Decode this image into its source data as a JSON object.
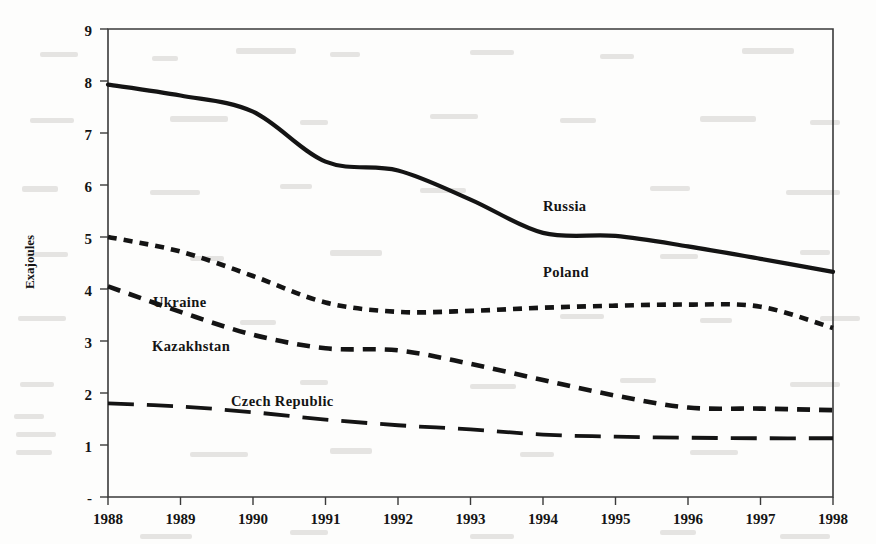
{
  "figure": {
    "background_color": "#fdfdfc",
    "ink_color": "#141414",
    "axis_color": "#3a3a3a"
  },
  "axes": {
    "y_axis_title": "Exajoules",
    "y_ticks": [
      "9",
      "8",
      "7",
      "6",
      "5",
      "4",
      "3",
      "2",
      "1",
      "-"
    ],
    "x_ticks": [
      "1988",
      "1989",
      "1990",
      "1991",
      "1992",
      "1993",
      "1994",
      "1995",
      "1996",
      "1997",
      "1998"
    ]
  },
  "series_labels": {
    "russia": "Russia",
    "poland": "Poland",
    "ukraine": "Ukraine",
    "kazakhstan": "Kazakhstan",
    "czech_republic": "Czech Republic"
  },
  "chart_data": {
    "type": "line",
    "title": "",
    "xlabel": "",
    "ylabel": "Exajoules",
    "xlim": [
      1988,
      1998
    ],
    "ylim": [
      0,
      9
    ],
    "grid": false,
    "legend": "inline-labels",
    "x": [
      1988,
      1989,
      1990,
      1991,
      1992,
      1993,
      1994,
      1995,
      1996,
      1997,
      1998
    ],
    "categories": [
      "1988",
      "1989",
      "1990",
      "1991",
      "1992",
      "1993",
      "1994",
      "1995",
      "1996",
      "1997",
      "1998"
    ],
    "series": [
      {
        "name": "Russia",
        "style": "solid",
        "label_text": "Russia",
        "values": [
          7.93,
          7.72,
          7.41,
          6.45,
          6.28,
          5.72,
          5.08,
          5.02,
          4.82,
          4.58,
          4.33
        ]
      },
      {
        "name": "Poland",
        "style": "short-dash",
        "label_text": "Poland",
        "values": [
          5.0,
          4.72,
          4.25,
          3.74,
          3.56,
          3.58,
          3.64,
          3.68,
          3.7,
          3.66,
          3.25
        ]
      },
      {
        "name": "Ukraine",
        "style": "short-dash",
        "label_text": "Ukraine",
        "values": [
          5.0,
          4.72,
          4.25,
          3.74,
          3.56,
          3.58,
          3.64,
          3.68,
          3.7,
          3.66,
          3.25
        ]
      },
      {
        "name": "Kazakhstan",
        "style": "medium-dash",
        "label_text": "Kazakhstan",
        "values": [
          4.05,
          3.56,
          3.12,
          2.86,
          2.82,
          2.56,
          2.25,
          1.95,
          1.72,
          1.7,
          1.67
        ]
      },
      {
        "name": "Czech Republic",
        "style": "long-dash",
        "label_text": "Czech Republic",
        "values": [
          1.8,
          1.74,
          1.63,
          1.49,
          1.38,
          1.3,
          1.2,
          1.16,
          1.14,
          1.13,
          1.13
        ]
      }
    ],
    "annotations": [
      {
        "text": "Russia",
        "x": 1993.6,
        "y": 5.45
      },
      {
        "text": "Poland",
        "x": 1993.6,
        "y": 4.4
      },
      {
        "text": "Ukraine",
        "x": 1988.8,
        "y": 3.82
      },
      {
        "text": "Kazakhstan",
        "x": 1988.7,
        "y": 3.08
      },
      {
        "text": "Czech Republic",
        "x": 1989.9,
        "y": 2.01
      }
    ]
  }
}
